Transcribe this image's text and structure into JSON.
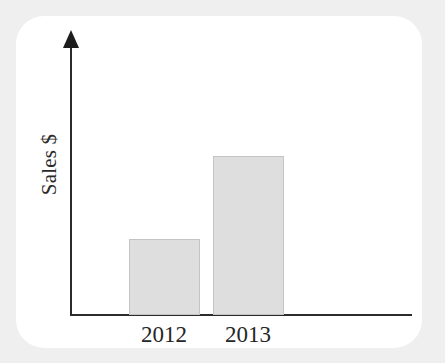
{
  "chart_data": {
    "type": "bar",
    "title": "",
    "subtitle": "",
    "xlabel": "",
    "ylabel": "Sales $",
    "categories": [
      "2012",
      "2013"
    ],
    "values": [
      76,
      159
    ],
    "value_unit": "pixels (unlabeled axis)",
    "ylim": [
      0,
      275
    ],
    "grid": false,
    "legend": null,
    "axis_ticks": {
      "x": [
        "2012",
        "2013"
      ],
      "y": []
    },
    "annotations": []
  },
  "style": {
    "page_background": "#efefef",
    "card_background": "#ffffff",
    "axis_color": "#2b2b2b",
    "bar_fill": "#dedede",
    "bar_stroke": "#c4c4c4",
    "text_color": "#262626"
  },
  "icons": {
    "y_axis_arrow": "arrow-up-icon"
  }
}
